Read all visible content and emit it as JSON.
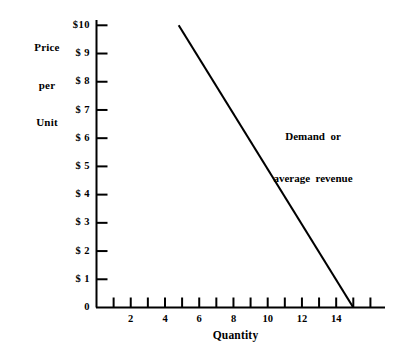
{
  "chart_data": {
    "type": "line",
    "title": "",
    "xlabel": "Quantity",
    "ylabel_lines": [
      "Price",
      "per",
      "Unit"
    ],
    "ylabel": "Price per Unit",
    "xlim": [
      0,
      17
    ],
    "ylim": [
      0,
      10.2
    ],
    "grid": false,
    "legend_position": "inline-annotation",
    "annotations": [
      {
        "lines": [
          "Demand  or",
          "average  revenue"
        ],
        "text": "Demand or average revenue",
        "x": 9.2,
        "y": 7.1
      }
    ],
    "y_ticks": [
      0,
      1,
      2,
      3,
      4,
      5,
      6,
      7,
      8,
      9,
      10
    ],
    "y_tick_labels": [
      "0",
      "$ 1",
      "$ 2",
      "$ 3",
      "$ 4",
      "$ 5",
      "$ 6",
      "$ 7",
      "$ 8",
      "$ 9",
      "$10"
    ],
    "x_ticks": [
      1,
      2,
      3,
      4,
      5,
      6,
      7,
      8,
      9,
      10,
      11,
      12,
      13,
      14,
      15,
      16
    ],
    "x_tick_labels": [
      {
        "value": 2,
        "label": "2"
      },
      {
        "value": 4,
        "label": "4"
      },
      {
        "value": 6,
        "label": "6"
      },
      {
        "value": 8,
        "label": "8"
      },
      {
        "value": 10,
        "label": "10"
      },
      {
        "value": 12,
        "label": "12"
      },
      {
        "value": 14,
        "label": "14"
      }
    ],
    "series": [
      {
        "name": "Demand or average revenue",
        "x": [
          4.8,
          15.0
        ],
        "values": [
          10.0,
          0.0
        ],
        "points": [
          [
            4.8,
            10.0
          ],
          [
            15.0,
            0.0
          ]
        ],
        "color": "#000000",
        "line_width": 2.1
      }
    ],
    "colors": {
      "axis": "#000000",
      "line": "#000000",
      "background": "#ffffff",
      "text": "#000000"
    }
  }
}
